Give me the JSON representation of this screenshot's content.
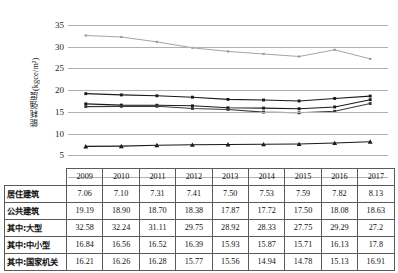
{
  "chart_data": {
    "type": "line",
    "title": "",
    "xlabel": "",
    "ylabel": "能耗强度(kgce/m²)",
    "ylim": [
      0,
      35
    ],
    "yticks": [
      35,
      30,
      25,
      20,
      15,
      10,
      5,
      0
    ],
    "grid": true,
    "legend_position": "none",
    "categories": [
      "2009",
      "2010",
      "2011",
      "2012",
      "2013",
      "2014",
      "2015",
      "2016",
      "2017"
    ],
    "series": [
      {
        "name": "居住建筑",
        "marker": "triangle",
        "color": "#1a1a1a",
        "values": [
          7.06,
          7.1,
          7.31,
          7.41,
          7.5,
          7.53,
          7.59,
          7.82,
          8.13
        ]
      },
      {
        "name": "公共建筑",
        "marker": "square",
        "color": "#1a1a1a",
        "values": [
          19.19,
          18.9,
          18.7,
          18.38,
          17.87,
          17.72,
          17.5,
          18.08,
          18.63
        ]
      },
      {
        "name": "其中:大型",
        "marker": "square",
        "color": "#9a9a9a",
        "values": [
          32.58,
          32.24,
          31.11,
          29.75,
          28.92,
          28.33,
          27.75,
          29.29,
          27.2
        ]
      },
      {
        "name": "其中:中小型",
        "marker": "square",
        "color": "#1a1a1a",
        "values": [
          16.84,
          16.56,
          16.52,
          16.39,
          15.93,
          15.87,
          15.71,
          16.13,
          17.8
        ]
      },
      {
        "name": "其中:国家机关",
        "marker": "square",
        "color": "#3a3a3a",
        "values": [
          16.21,
          16.26,
          16.28,
          15.77,
          15.56,
          14.94,
          14.78,
          15.13,
          16.91
        ]
      }
    ]
  },
  "table": {
    "corner_label": "",
    "columns": [
      "2009",
      "2010",
      "2011",
      "2012",
      "2013",
      "2014",
      "2015",
      "2016",
      "2017"
    ],
    "rows": [
      {
        "label": "居住建筑",
        "values": [
          "7.06",
          "7.10",
          "7.31",
          "7.41",
          "7.50",
          "7.53",
          "7.59",
          "7.82",
          "8.13"
        ]
      },
      {
        "label": "公共建筑",
        "values": [
          "19.19",
          "18.90",
          "18.70",
          "18.38",
          "17.87",
          "17.72",
          "17.50",
          "18.08",
          "18.63"
        ]
      },
      {
        "label": "其中:大型",
        "values": [
          "32.58",
          "32.24",
          "31.11",
          "29.75",
          "28.92",
          "28.33",
          "27.75",
          "29.29",
          "27.2"
        ]
      },
      {
        "label": "其中:中小型",
        "values": [
          "16.84",
          "16.56",
          "16.52",
          "16.39",
          "15.93",
          "15.87",
          "15.71",
          "16.13",
          "17.8"
        ]
      },
      {
        "label": "其中:国家机关",
        "values": [
          "16.21",
          "16.26",
          "16.28",
          "15.77",
          "15.56",
          "14.94",
          "14.78",
          "15.13",
          "16.91"
        ]
      }
    ]
  },
  "axis": {
    "zero_label": "0",
    "tick_35": "35",
    "tick_30": "30",
    "tick_25": "25",
    "tick_20": "20",
    "tick_15": "15",
    "tick_10": "10",
    "tick_5": "5"
  }
}
